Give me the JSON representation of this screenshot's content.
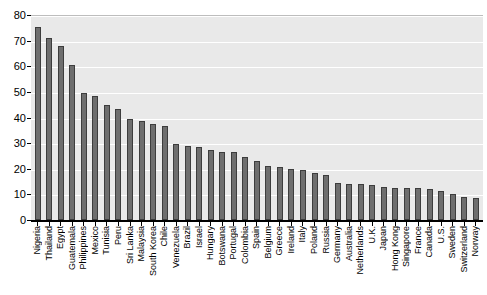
{
  "chart_data": {
    "type": "bar",
    "title": "",
    "subtitle": "",
    "xlabel": "",
    "ylabel": "",
    "ylim": [
      0,
      80
    ],
    "ytick_labels": [
      "0",
      "10",
      "20",
      "30",
      "40",
      "50",
      "60",
      "70",
      "80"
    ],
    "ytick_values": [
      0,
      10,
      20,
      30,
      40,
      50,
      60,
      70,
      80
    ],
    "grid": true,
    "legend": "none",
    "bar_color": "#6e6e6e",
    "bar_edge_color": "#3d3d3d",
    "plot_background": "#e9e9e9",
    "gridline_color": "#ffffff",
    "categories": [
      "Nigeria",
      "Thailand",
      "Egypt",
      "Guatemala",
      "Philippines",
      "Mexico",
      "Tunisia",
      "Peru",
      "Sri Lanka",
      "Malaysia",
      "South Korea",
      "Chile",
      "Venezuela",
      "Brazil",
      "Israel",
      "Hungary",
      "Botswana",
      "Portugal",
      "Colombia",
      "Spain",
      "Belgium",
      "Greece",
      "Ireland",
      "Italy",
      "Poland",
      "Russia",
      "Germany",
      "Australia",
      "Netherlands",
      "U.K.",
      "Japan",
      "Hong Kong",
      "Singapore",
      "France",
      "Canada",
      "U.S.",
      "Sweden",
      "Switzerland",
      "Norway"
    ],
    "values": [
      75.5,
      71,
      68,
      60.5,
      49.5,
      48.5,
      45,
      43.5,
      39.5,
      38.5,
      37.5,
      36.5,
      29.5,
      29,
      28.5,
      27.5,
      26.5,
      26.5,
      24.5,
      23,
      21,
      20.5,
      20,
      19.5,
      18.5,
      17.5,
      14.5,
      14,
      14,
      13.5,
      13,
      12.5,
      12.5,
      12.5,
      12,
      11.5,
      10,
      9,
      8.5
    ]
  }
}
